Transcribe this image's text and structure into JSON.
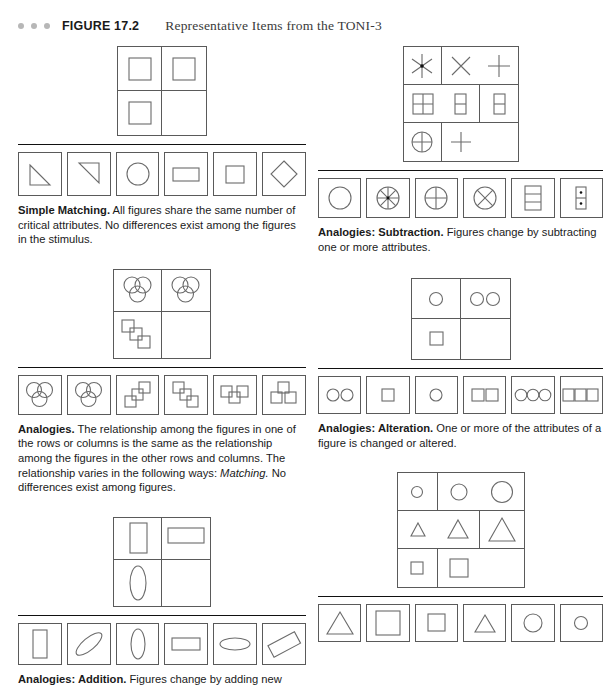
{
  "header": {
    "figure_label": "FIGURE 17.2",
    "figure_title": "Representative Items from the TONI-3",
    "dot_count": 3,
    "dot_color": "#b7b7b7"
  },
  "colors": {
    "stroke": "#6b6b6b",
    "frame": "#5a5a5a",
    "rule": "#111111",
    "text": "#1a1a1a"
  },
  "sections": [
    {
      "id": "simple-matching",
      "column": "left",
      "stimulus": {
        "type": "matrix",
        "rows": 2,
        "cols": 2,
        "cells": [
          "square",
          "square",
          "square",
          "empty"
        ]
      },
      "options": [
        "triangle-lower-left",
        "triangle-upper-right",
        "circle",
        "rectangle-wide",
        "square",
        "diamond"
      ],
      "caption_bold": "Simple Matching.",
      "caption_text": " All figures share the same number of critical attributes. No differences exist among the figures in the stimulus."
    },
    {
      "id": "analogies",
      "column": "left",
      "stimulus": {
        "type": "matrix",
        "rows": 2,
        "cols": 2,
        "cells": [
          "three-circles-venn",
          "three-circles-venn",
          "three-squares-cascade",
          "empty"
        ]
      },
      "options": [
        "three-circles-venn",
        "three-circles-venn",
        "three-squares-cascade-up",
        "three-squares-cascade-down",
        "three-squares-row-overlap",
        "three-squares-cluster"
      ],
      "caption_bold": "Analogies.",
      "caption_text": " The relationship among the figures in one of the rows or columns is the same as the relationship among the figures in the other rows and columns. The relationship varies in the following ways: ",
      "caption_italic": "Matching.",
      "caption_tail": " No differences exist among figures."
    },
    {
      "id": "analogies-addition",
      "column": "left",
      "stimulus": {
        "type": "matrix",
        "rows": 2,
        "cols": 2,
        "cells": [
          "rect-vertical",
          "rect-horizontal",
          "ellipse-vertical",
          "empty"
        ]
      },
      "options": [
        "rect-vertical",
        "ellipse-diagonal",
        "ellipse-vertical",
        "rect-horizontal",
        "ellipse-horizontal",
        "rect-diagonal"
      ],
      "caption_bold": "Analogies: Addition.",
      "caption_text": " Figures change by adding new"
    },
    {
      "id": "analogies-subtraction",
      "column": "right",
      "stimulus": {
        "type": "matrix",
        "rows": 3,
        "cols": 3,
        "cells": [
          "asterisk-6",
          "x-cross",
          "plus",
          "square-quartered",
          "rect-halved",
          "rect-halved",
          "circle-crossed",
          "plus",
          "empty"
        ]
      },
      "options": [
        "circle",
        "circle-8-spokes",
        "circle-crossed",
        "circle-x",
        "rect-thirds",
        "rect-two-dots"
      ],
      "caption_bold": "Analogies: Subtraction.",
      "caption_text": " Figures change by subtracting one or more attributes."
    },
    {
      "id": "analogies-alteration",
      "column": "right",
      "stimulus": {
        "type": "matrix",
        "rows": 2,
        "cols": 2,
        "cells": [
          "one-circle",
          "two-circles",
          "one-square",
          "empty"
        ]
      },
      "options": [
        "two-circles",
        "one-square",
        "one-circle",
        "two-squares",
        "three-circles",
        "three-squares"
      ],
      "caption_bold": "Analogies: Alteration.",
      "caption_text": " One or more of the attributes of a figure is changed or altered."
    },
    {
      "id": "analogies-progression",
      "column": "right",
      "stimulus": {
        "type": "matrix",
        "rows": 3,
        "cols": 3,
        "cells": [
          "circle-small",
          "circle-medium",
          "circle-large",
          "triangle-small",
          "triangle-medium",
          "triangle-large",
          "square-small",
          "square-medium",
          "empty"
        ]
      },
      "options": [
        "triangle-large",
        "square-large",
        "square-medium",
        "triangle-medium",
        "circle-medium",
        "circle-small"
      ],
      "caption_bold": "",
      "caption_text": ""
    }
  ]
}
